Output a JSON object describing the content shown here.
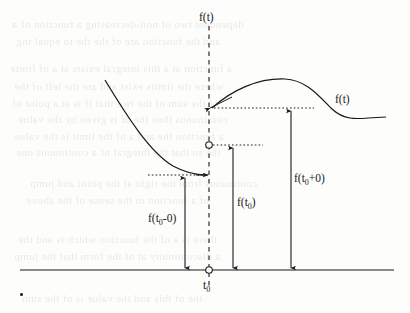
{
  "figure": {
    "type": "mathematical-diagram",
    "background_color": "#fdfdfc",
    "ink_color": "#1a1a1a"
  },
  "labels": {
    "axis_function": "f(t)",
    "curve_function": "f(t)",
    "left_limit": "f(t",
    "left_limit_sub": "0",
    "left_limit_tail": "-0)",
    "value_at_point": "f(t",
    "value_at_point_sub": "0",
    "value_at_point_tail": ")",
    "right_limit": "f(t",
    "right_limit_sub": "0",
    "right_limit_sup": "+0)",
    "t_zero": "t",
    "t_zero_sub": "0"
  },
  "geometry": {
    "horizontal_axis": {
      "x1": 20,
      "y1": 270,
      "x2": 394,
      "y2": 270
    },
    "vertical_dashed_axis": {
      "x": 209,
      "y_top": 26,
      "y_bottom": 288
    },
    "discontinuity_x": 209,
    "left_limit_y": 175,
    "value_y": 145,
    "right_limit_y": 108,
    "open_circle_on_axis": {
      "cx": 209,
      "cy": 270,
      "r": 3.2
    },
    "open_circle_value": {
      "cx": 209,
      "cy": 145,
      "r": 3.2
    },
    "measure_arrow_left_x": 185,
    "measure_arrow_mid_x": 233,
    "measure_arrow_right_x": 291,
    "left_curve": {
      "start_x": 105,
      "start_y": 80,
      "end_x": 206,
      "end_y": 175
    },
    "right_curve": {
      "start_x": 212,
      "start_y": 108,
      "peak_x": 290,
      "peak_y": 79,
      "end_x": 386,
      "end_y": 117
    },
    "dotted_left": {
      "x1": 148,
      "x2": 207,
      "y": 175
    },
    "dotted_mid": {
      "x1": 212,
      "x2": 263,
      "y": 145
    },
    "dotted_right": {
      "x1": 212,
      "x2": 314,
      "y": 108
    }
  },
  "ghost_text": {
    "note": "faint show-through of printed text from the reverse side of the scanned page",
    "lines": [
      {
        "text": "dependent  two  of  non-decreasing  a  function  of  a",
        "x": 12,
        "y": 18,
        "size": 11
      },
      {
        "text": "and  the  function  are  of  the  the  to  equal  ing",
        "x": 16,
        "y": 35,
        "size": 11
      },
      {
        "text": "a  function  at  a  this  integral  exists  at  a  of  finite",
        "x": 10,
        "y": 62,
        "size": 11
      },
      {
        "text": "where  the  limits  exist  and  are  the  left  of  the",
        "x": 14,
        "y": 80,
        "size": 11
      },
      {
        "text": "of  the  sum  of  the  two  that  if  is  at  a  point  of",
        "x": 12,
        "y": 97,
        "size": 11
      },
      {
        "text": "continuous  then  the  of  is  given  by  the  value",
        "x": 18,
        "y": 113,
        "size": 11
      },
      {
        "text": "a  function  the  and  a  of  the  limit  is  the  value",
        "x": 14,
        "y": 130,
        "size": 11
      },
      {
        "text": "the  so  that  the  integral  of  a  continuous  one",
        "x": 16,
        "y": 146,
        "size": 11
      },
      {
        "text": "continuous  from  the  right  at  the  point  and  jump",
        "x": 30,
        "y": 177,
        "size": 11
      },
      {
        "text": "of  a  function  in  the  sense  of  the  above",
        "x": 26,
        "y": 194,
        "size": 11
      },
      {
        "text": "there  is  a  of  the  function  which  is  and  the",
        "x": 18,
        "y": 233,
        "size": 11
      },
      {
        "text": "a  discontinuity  at  of  the  form  that  the  jump",
        "x": 14,
        "y": 250,
        "size": 11
      },
      {
        "text": "the  of  this  and  the  value  is  of  the  sum",
        "x": 22,
        "y": 292,
        "size": 11
      }
    ]
  }
}
